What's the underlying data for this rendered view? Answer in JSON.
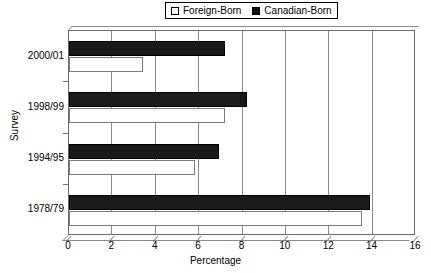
{
  "chart_data": {
    "type": "bar",
    "orientation": "horizontal",
    "title": "",
    "xlabel": "Percentage",
    "ylabel": "Survey",
    "categories": [
      "2000/01",
      "1998/99",
      "1994/95",
      "1978/79"
    ],
    "series": [
      {
        "name": "Foreign-Born",
        "values": [
          3.4,
          7.2,
          5.8,
          13.5
        ],
        "color": "#ffffff",
        "swatch": "open"
      },
      {
        "name": "Canadian-Born",
        "values": [
          7.2,
          8.2,
          6.9,
          13.9
        ],
        "color": "#1a1a1a",
        "swatch": "filled"
      }
    ],
    "xlim": [
      0,
      16
    ],
    "xticks": [
      0,
      2,
      4,
      6,
      8,
      10,
      12,
      14,
      16
    ],
    "xtick_labels": [
      "0",
      "2",
      "4",
      "6",
      "8",
      "10",
      "12",
      "14",
      "16"
    ],
    "grid": "vertical",
    "legend_position": "top-center"
  },
  "legend": {
    "entries": [
      {
        "label": "Foreign-Born"
      },
      {
        "label": "Canadian-Born"
      }
    ]
  },
  "axes": {
    "x_title": "Percentage",
    "y_title": "Survey"
  }
}
